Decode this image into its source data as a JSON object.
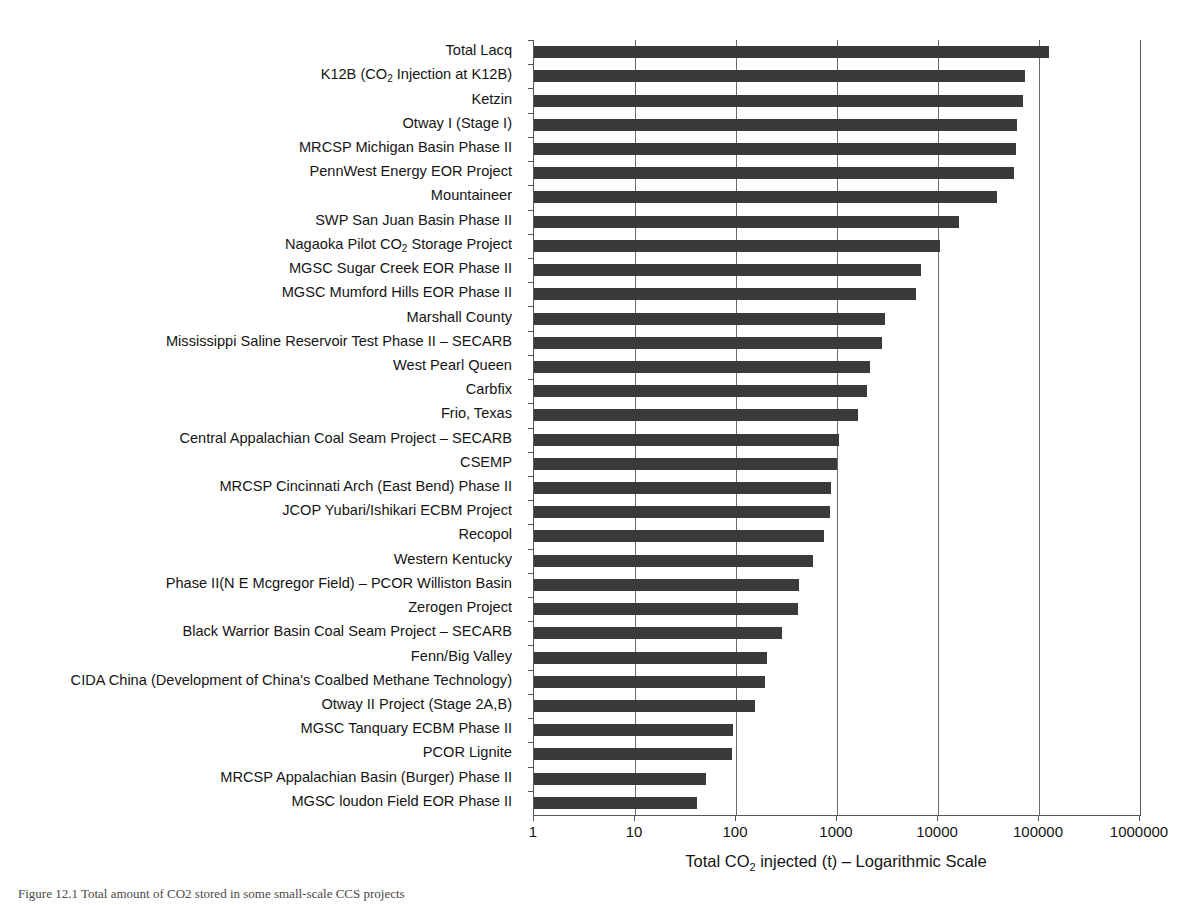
{
  "chart_data": {
    "type": "bar",
    "orientation": "horizontal",
    "title": "",
    "xlabel": "Total CO2 injected (t) – Logarithmic Scale",
    "xlabel_parts": {
      "pre": "Total CO",
      "sub": "2",
      "post": " injected (t) – Logarithmic Scale"
    },
    "ylabel": "",
    "xscale": "log",
    "xlim": [
      1,
      1000000
    ],
    "xticks": [
      1,
      10,
      100,
      1000,
      10000,
      100000,
      1000000
    ],
    "xticklabels": [
      "1",
      "10",
      "100",
      "1000",
      "10000",
      "100000",
      "1000000"
    ],
    "grid": "vertical",
    "legend": "none",
    "bar_color": "#3a3a3a",
    "categories": [
      "Total Lacq",
      "K12B (CO2 Injection at K12B)",
      "Ketzin",
      "Otway I (Stage I)",
      "MRCSP Michigan Basin Phase II",
      "PennWest Energy EOR Project",
      "Mountaineer",
      "SWP San Juan Basin Phase II",
      "Nagaoka Pilot CO2 Storage Project",
      "MGSC Sugar Creek EOR Phase II",
      "MGSC Mumford Hills EOR Phase II",
      "Marshall County",
      "Mississippi Saline Reservoir Test Phase II – SECARB",
      "West Pearl Queen",
      "Carbfix",
      "Frio, Texas",
      "Central Appalachian Coal Seam Project – SECARB",
      "CSEMP",
      "MRCSP Cincinnati Arch (East Bend) Phase II",
      "JCOP Yubari/Ishikari ECBM Project",
      "Recopol",
      "Western Kentucky",
      "Phase II(N E Mcgregor Field) – PCOR Williston Basin",
      "Zerogen Project",
      "Black Warrior Basin Coal Seam Project – SECARB",
      "Fenn/Big Valley",
      "CIDA China (Development of China's Coalbed Methane Technology)",
      "Otway II Project (Stage 2A,B)",
      "MGSC Tanquary ECBM Phase II",
      "PCOR Lignite",
      "MRCSP Appalachian Basin (Burger) Phase II",
      "MGSC loudon Field EOR Phase II"
    ],
    "category_labels_html": [
      "Total Lacq",
      "K12B (CO<sub>2</sub> Injection at K12B)",
      "Ketzin",
      "Otway I (Stage I)",
      "MRCSP Michigan Basin Phase II",
      "PennWest Energy EOR Project",
      "Mountaineer",
      "SWP San Juan Basin Phase II",
      "Nagaoka Pilot CO<sub>2</sub> Storage Project",
      "MGSC Sugar Creek EOR Phase II",
      "MGSC Mumford Hills EOR Phase II",
      "Marshall County",
      "Mississippi Saline Reservoir Test Phase II &#8211; SECARB",
      "West Pearl Queen",
      "Carbfix",
      "Frio, Texas",
      "Central Appalachian Coal Seam Project &#8211; SECARB",
      "CSEMP",
      "MRCSP Cincinnati Arch (East Bend) Phase II",
      "JCOP Yubari/Ishikari ECBM Project",
      "Recopol",
      "Western Kentucky",
      "Phase II(N E Mcgregor Field) &#8211; PCOR Williston Basin",
      "Zerogen Project",
      "Black Warrior Basin Coal Seam Project &#8211; SECARB",
      "Fenn/Big Valley",
      "CIDA China (Development of China's Coalbed Methane Technology)",
      "Otway II Project (Stage 2A,B)",
      "MGSC Tanquary ECBM Phase II",
      "PCOR Lignite",
      "MRCSP Appalachian Basin (Burger) Phase II",
      "MGSC loudon Field EOR Phase II"
    ],
    "values": [
      125000,
      72000,
      70000,
      61000,
      59000,
      57000,
      38000,
      16000,
      10400,
      6800,
      6100,
      3000,
      2800,
      2100,
      2000,
      1600,
      1050,
      1000,
      880,
      860,
      750,
      580,
      420,
      410,
      285,
      205,
      195,
      155,
      94,
      92,
      51,
      41
    ]
  },
  "caption": {
    "text": "Figure 12.1 Total amount of CO2 stored in some small-scale CCS projects"
  }
}
